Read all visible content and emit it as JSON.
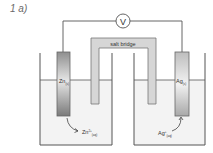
{
  "question_label": "1 a)",
  "voltmeter": {
    "symbol": "V"
  },
  "salt_bridge": {
    "label": "salt bridge"
  },
  "left_half_cell": {
    "electrode": {
      "symbol": "Zn",
      "state": "(s)"
    },
    "ion": {
      "symbol": "Zn",
      "charge": "2+",
      "state": "(aq)"
    }
  },
  "right_half_cell": {
    "electrode": {
      "symbol": "Ag",
      "state": "(s)"
    },
    "ion": {
      "symbol": "Ag",
      "charge": "+",
      "state": "(aq)"
    }
  },
  "colors": {
    "line": "#555555",
    "solution": "#f2f2f2",
    "bridge": "#d4d4d4",
    "zn_electrode": "#9a9a9a",
    "ag_electrode": "#c8c8c8"
  }
}
